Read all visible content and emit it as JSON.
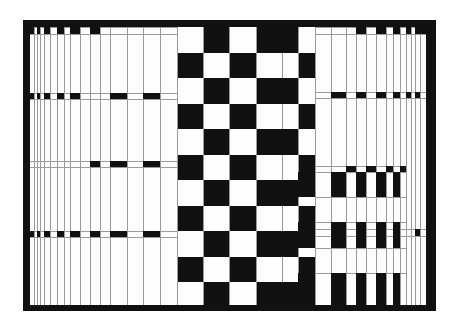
{
  "artwork": {
    "style": "op-art black and white checkerboard with graduated vertical stripes",
    "colors": {
      "ink": "#111111",
      "paper": "#fdfdfd",
      "line": "#9a9a9a",
      "background": "#ffffff"
    },
    "frame": {
      "outer": [
        23,
        20,
        436,
        311
      ],
      "inner": [
        30,
        27,
        426,
        305
      ]
    },
    "checker": {
      "row_tops": [
        27,
        53,
        78,
        104,
        129,
        155,
        180,
        206,
        231,
        257,
        282,
        305
      ],
      "cols": [
        {
          "x0": 177,
          "x1": 203,
          "phase": 0
        },
        {
          "x0": 203,
          "x1": 229,
          "phase": 1
        },
        {
          "x0": 229,
          "x1": 256,
          "phase": 0
        },
        {
          "x0": 256,
          "x1": 298,
          "phase": 1,
          "divider": 282
        },
        {
          "x0": 298,
          "x1": 315,
          "phase": 0
        }
      ]
    },
    "left_stripes": {
      "x": [
        34,
        37,
        40,
        44,
        50,
        57,
        64,
        70,
        80,
        90,
        100,
        110,
        127,
        143,
        160,
        177
      ],
      "bands": [
        {
          "y": 27,
          "h": 7,
          "blacks": [
            [
              30,
              34
            ],
            [
              37,
              40
            ],
            [
              44,
              50
            ],
            [
              57,
              64
            ],
            [
              70,
              80
            ],
            [
              90,
              100
            ]
          ]
        },
        {
          "y": 93,
          "h": 6,
          "blacks": [
            [
              30,
              34
            ],
            [
              37,
              40
            ],
            [
              44,
              50
            ],
            [
              57,
              64
            ],
            [
              70,
              80
            ],
            [
              110,
              127
            ],
            [
              143,
              160
            ]
          ]
        },
        {
          "y": 161,
          "h": 6,
          "blacks": [
            [
              90,
              100
            ],
            [
              110,
              127
            ],
            [
              143,
              160
            ]
          ]
        },
        {
          "y": 231,
          "h": 6,
          "blacks": [
            [
              30,
              34
            ],
            [
              37,
              40
            ],
            [
              44,
              50
            ],
            [
              57,
              64
            ],
            [
              70,
              80
            ],
            [
              90,
              100
            ],
            [
              110,
              127
            ],
            [
              143,
              160
            ]
          ]
        }
      ]
    },
    "right_stripes": {
      "x": [
        315,
        331,
        346,
        356,
        366,
        376,
        386,
        393,
        400,
        406,
        411,
        415,
        420
      ],
      "bands": [
        {
          "y": 27,
          "h": 7,
          "blacks": [
            [
              356,
              366
            ],
            [
              376,
              386
            ],
            [
              393,
              400
            ],
            [
              406,
              411
            ],
            [
              415,
              420
            ],
            [
              420,
              426
            ]
          ]
        },
        {
          "y": 92,
          "h": 6,
          "blacks": [
            [
              331,
              346
            ],
            [
              356,
              366
            ],
            [
              376,
              386
            ],
            [
              393,
              400
            ],
            [
              406,
              411
            ],
            [
              415,
              420
            ]
          ]
        },
        {
          "y": 229,
          "h": 7,
          "blacks": [
            [
              415,
              420
            ]
          ]
        }
      ],
      "grid_zone": {
        "x0": 315,
        "x1": 406,
        "rows": [
          {
            "y0": 172,
            "y1": 197,
            "blacks": [
              [
                331,
                346
              ],
              [
                356,
                366
              ],
              [
                376,
                386
              ],
              [
                393,
                400
              ]
            ]
          },
          {
            "y0": 197,
            "y1": 222,
            "blacks": []
          },
          {
            "y0": 222,
            "y1": 248,
            "blacks": [
              [
                331,
                346
              ],
              [
                356,
                366
              ],
              [
                376,
                386
              ],
              [
                393,
                400
              ]
            ]
          },
          {
            "y0": 248,
            "y1": 273,
            "blacks": []
          },
          {
            "y0": 273,
            "y1": 305,
            "blacks": [
              [
                331,
                346
              ],
              [
                356,
                366
              ],
              [
                376,
                386
              ],
              [
                393,
                400
              ]
            ]
          }
        ],
        "top_band": {
          "y": 166,
          "h": 6,
          "blacks": [
            [
              346,
              356
            ],
            [
              366,
              376
            ],
            [
              386,
              393
            ],
            [
              400,
              406
            ]
          ]
        }
      }
    }
  }
}
